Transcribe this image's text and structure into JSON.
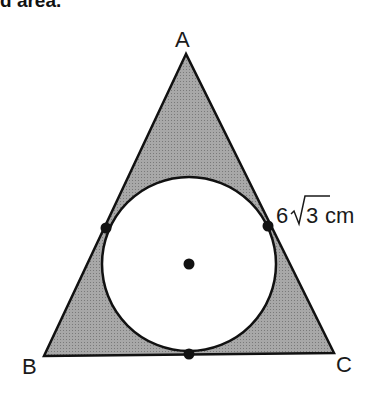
{
  "header": {
    "text_fragment": "d area."
  },
  "diagram": {
    "type": "geometry",
    "vertices": [
      {
        "label": "A",
        "x": 186,
        "y": 54
      },
      {
        "label": "B",
        "x": 44,
        "y": 356
      },
      {
        "label": "C",
        "x": 334,
        "y": 353
      }
    ],
    "circle": {
      "cx": 189,
      "cy": 264,
      "r": 87
    },
    "tangent_points": [
      {
        "x": 106,
        "y": 228
      },
      {
        "x": 268,
        "y": 226
      },
      {
        "x": 189,
        "y": 354
      }
    ],
    "center_point": {
      "x": 189,
      "y": 264
    },
    "measurement": {
      "coefficient": "6",
      "radicand": "3",
      "unit": "cm"
    },
    "colors": {
      "shade": "#9a9a9a",
      "stroke": "#111111"
    }
  }
}
